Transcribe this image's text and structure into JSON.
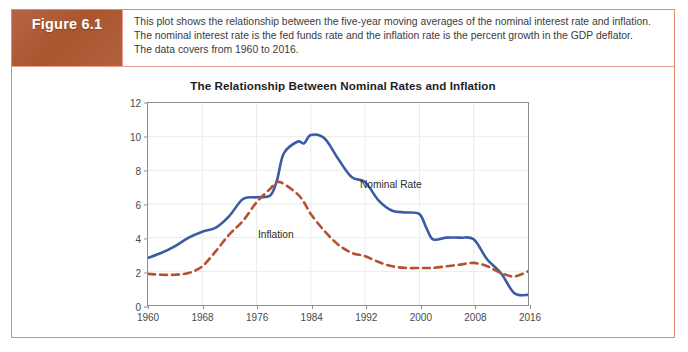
{
  "figure": {
    "badge_label": "Figure 6.1",
    "caption_lines": [
      "This plot shows the relationship between the five-year moving averages of the nominal interest rate and inflation.",
      "The nominal interest rate is the fed funds rate and the inflation rate is the percent growth in the GDP deflator.",
      "The data covers from 1960 to 2016."
    ]
  },
  "colors": {
    "badge_background": "#b05c3e",
    "card_border": "#e08a74",
    "nominal_rate_line": "#3b5ba5",
    "inflation_line": "#b5512f",
    "axis": "#8d8d8f",
    "gridline": "#ebebeb"
  },
  "chart_data": {
    "type": "line",
    "title": "The Relationship Between Nominal Rates and Inflation",
    "xlabel": "",
    "ylabel": "",
    "xlim": [
      1960,
      2016
    ],
    "ylim": [
      0,
      12
    ],
    "grid": true,
    "legend_position": "inline-annotation",
    "xticks": [
      1960,
      1968,
      1976,
      1984,
      1992,
      2000,
      2008,
      2016
    ],
    "yticks": [
      0,
      2,
      4,
      6,
      8,
      10,
      12
    ],
    "x": [
      1960,
      1962,
      1964,
      1966,
      1968,
      1970,
      1972,
      1974,
      1976,
      1978,
      1979,
      1980,
      1982,
      1983,
      1984,
      1986,
      1988,
      1990,
      1992,
      1994,
      1996,
      1998,
      2000,
      2001,
      2002,
      2004,
      2006,
      2008,
      2010,
      2012,
      2014,
      2016
    ],
    "series": [
      {
        "name": "Nominal Rate",
        "style": "solid",
        "color": "#3b5ba5",
        "values": [
          2.8,
          3.1,
          3.5,
          4.0,
          4.35,
          4.6,
          5.3,
          6.3,
          6.4,
          6.5,
          7.4,
          9.0,
          9.7,
          9.6,
          10.1,
          9.9,
          8.7,
          7.6,
          7.3,
          6.2,
          5.6,
          5.5,
          5.4,
          4.6,
          3.9,
          4.0,
          4.0,
          3.9,
          2.7,
          1.9,
          0.7,
          0.6
        ]
      },
      {
        "name": "Inflation",
        "style": "dashed",
        "color": "#b5512f",
        "values": [
          1.85,
          1.8,
          1.8,
          1.9,
          2.3,
          3.2,
          4.2,
          5.0,
          6.1,
          6.9,
          7.3,
          7.2,
          6.6,
          6.1,
          5.4,
          4.4,
          3.6,
          3.1,
          2.9,
          2.55,
          2.3,
          2.2,
          2.2,
          2.2,
          2.2,
          2.3,
          2.4,
          2.5,
          2.3,
          1.9,
          1.7,
          2.0
        ]
      }
    ],
    "annotations": [
      {
        "text": "Nominal Rate",
        "series": "Nominal Rate"
      },
      {
        "text": "Inflation",
        "series": "Inflation"
      }
    ]
  }
}
